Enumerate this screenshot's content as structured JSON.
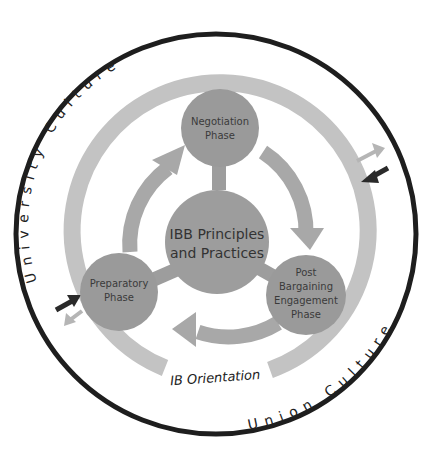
{
  "diagram": {
    "center": {
      "line1": "IBB Principles",
      "line2": "and Practices"
    },
    "phases": [
      {
        "name": "negotiation",
        "lines": [
          "Negotiation",
          "Phase"
        ]
      },
      {
        "name": "post-bargaining-engagement",
        "lines": [
          "Post",
          "Bargaining",
          "Engagement",
          "Phase"
        ]
      },
      {
        "name": "preparatory",
        "lines": [
          "Preparatory",
          "Phase"
        ]
      }
    ],
    "ring_label": "IB Orientation",
    "outer_labels": {
      "top": "University Culture",
      "bottom": "Union Culture"
    },
    "colors": {
      "outer_circle": "#1e1e1e",
      "ring": "#c3c3c3",
      "phase_circle": "#9a9a9a",
      "center_circle": "#9d9d9d",
      "cycle_arrow": "#a8a8a8",
      "dark_arrow": "#2a2a2a",
      "light_arrow": "#b5b5b5"
    }
  }
}
